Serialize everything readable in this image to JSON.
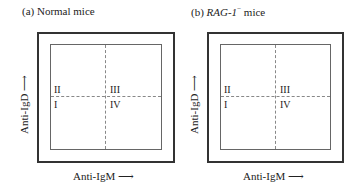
{
  "panels": [
    {
      "id": "a",
      "title_prefix": "(a) Normal mice",
      "quadrants": {
        "top_left": "II",
        "top_right": "III",
        "bottom_left": "I",
        "bottom_right": "IV"
      },
      "x_axis_label": "Anti-IgM",
      "y_axis_label": "Anti-IgD",
      "arrow_right": "⟶",
      "arrow_up": "⟶"
    },
    {
      "id": "b",
      "title_paren": "(b) ",
      "title_italic": "RAG-1",
      "title_sup": "−",
      "title_suffix": " mice",
      "quadrants": {
        "top_left": "II",
        "top_right": "III",
        "bottom_left": "I",
        "bottom_right": "IV"
      },
      "x_axis_label": "Anti-IgM",
      "y_axis_label": "Anti-IgD",
      "arrow_right": "⟶",
      "arrow_up": "⟶"
    }
  ]
}
